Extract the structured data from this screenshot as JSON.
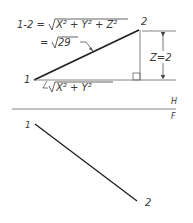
{
  "diagram": {
    "type": "descriptive-geometry-true-length",
    "top_view": {
      "formula_line1": "1-2 = √X² + Y² + Z²",
      "formula_lhs": "1-2 =",
      "formula_radical": "X² + Y² + Z²",
      "formula_line2_prefix": "=",
      "formula_line2_radical": "29",
      "point_1_label": "1",
      "point_2_label": "2",
      "z_dimension_label": "Z=2",
      "base_label_radical": "X² + Y²"
    },
    "fold_line": {
      "upper_label": "H",
      "lower_label": "F"
    },
    "bottom_view": {
      "point_1_label": "1",
      "point_2_label": "2"
    },
    "colors": {
      "line": "#1e1e1e",
      "thin_line": "#555555",
      "text": "#3a3a3a"
    }
  }
}
